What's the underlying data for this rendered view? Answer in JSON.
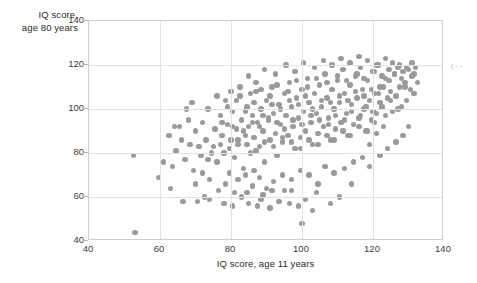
{
  "figure": {
    "background": "#ffffff",
    "point_color": "#9a9a9a",
    "grid_color": "#e2e2e2",
    "frame_color": "#cfcfcf"
  },
  "edge_marker": {
    "glyph": "‹··",
    "name": "collapse-arrow-icon",
    "color": "#d2d2d2"
  },
  "chart_data": {
    "type": "scatter",
    "title": "",
    "xlabel": "IQ score, age 11 years",
    "ylabel": "IQ score,\nage 80 years",
    "xlim": [
      40,
      140
    ],
    "ylim": [
      40,
      140
    ],
    "xticks": [
      40,
      60,
      80,
      100,
      120,
      140
    ],
    "yticks": [
      40,
      60,
      80,
      100,
      120,
      140
    ],
    "grid": true,
    "legend": null,
    "series": [
      {
        "name": "participants",
        "color": "#9a9a9a",
        "marker": "circle",
        "points": [
          [
            52.5,
            79
          ],
          [
            53.0,
            44
          ],
          [
            59.5,
            69
          ],
          [
            62.5,
            88
          ],
          [
            63.5,
            74
          ],
          [
            64.5,
            81
          ],
          [
            65.5,
            92
          ],
          [
            66.0,
            86
          ],
          [
            67.0,
            77
          ],
          [
            68.0,
            95
          ],
          [
            68.5,
            84
          ],
          [
            69.5,
            72
          ],
          [
            70.0,
            90
          ],
          [
            70.5,
            58
          ],
          [
            71.5,
            79
          ],
          [
            72.0,
            94
          ],
          [
            73.0,
            86
          ],
          [
            73.5,
            100
          ],
          [
            74.0,
            68
          ],
          [
            75.0,
            83
          ],
          [
            75.5,
            91
          ],
          [
            76.0,
            76
          ],
          [
            77.0,
            97
          ],
          [
            77.5,
            88
          ],
          [
            78.0,
            80
          ],
          [
            78.5,
            104
          ],
          [
            79.0,
            93
          ],
          [
            79.5,
            71
          ],
          [
            80.0,
            86
          ],
          [
            80.5,
            99
          ],
          [
            81.0,
            78
          ],
          [
            81.5,
            91
          ],
          [
            82.0,
            84
          ],
          [
            82.5,
            106
          ],
          [
            83.0,
            95
          ],
          [
            83.5,
            73
          ],
          [
            84.0,
            88
          ],
          [
            84.5,
            101
          ],
          [
            85.0,
            92
          ],
          [
            85.5,
            80
          ],
          [
            86.0,
            97
          ],
          [
            86.5,
            87
          ],
          [
            87.0,
            108
          ],
          [
            87.5,
            94
          ],
          [
            88.0,
            83
          ],
          [
            88.5,
            100
          ],
          [
            89.0,
            90
          ],
          [
            89.5,
            76
          ],
          [
            90.0,
            104
          ],
          [
            90.5,
            95
          ],
          [
            91.0,
            86
          ],
          [
            91.5,
            110
          ],
          [
            92.0,
            98
          ],
          [
            92.5,
            89
          ],
          [
            93.0,
            79
          ],
          [
            93.5,
            102
          ],
          [
            94.0,
            93
          ],
          [
            94.5,
            85
          ],
          [
            95.0,
            107
          ],
          [
            95.5,
            97
          ],
          [
            96.0,
            88
          ],
          [
            96.5,
            112
          ],
          [
            97.0,
            101
          ],
          [
            97.5,
            92
          ],
          [
            98.0,
            82
          ],
          [
            98.5,
            105
          ],
          [
            99.0,
            96
          ],
          [
            99.5,
            87
          ],
          [
            100.0,
            109
          ],
          [
            100.5,
            99
          ],
          [
            101.0,
            90
          ],
          [
            101.5,
            114
          ],
          [
            102.0,
            103
          ],
          [
            102.5,
            94
          ],
          [
            103.0,
            84
          ],
          [
            103.5,
            107
          ],
          [
            104.0,
            98
          ],
          [
            104.5,
            89
          ],
          [
            105.0,
            111
          ],
          [
            105.5,
            101
          ],
          [
            106.0,
            92
          ],
          [
            106.5,
            116
          ],
          [
            107.0,
            105
          ],
          [
            107.5,
            96
          ],
          [
            108.0,
            86
          ],
          [
            108.5,
            109
          ],
          [
            109.0,
            100
          ],
          [
            109.5,
            91
          ],
          [
            110.0,
            113
          ],
          [
            110.5,
            103
          ],
          [
            111.0,
            94
          ],
          [
            111.5,
            118
          ],
          [
            112.0,
            107
          ],
          [
            112.5,
            98
          ],
          [
            113.0,
            88
          ],
          [
            113.5,
            111
          ],
          [
            114.0,
            102
          ],
          [
            114.5,
            93
          ],
          [
            115.0,
            115
          ],
          [
            115.5,
            105
          ],
          [
            116.0,
            96
          ],
          [
            116.5,
            119
          ],
          [
            117.0,
            109
          ],
          [
            117.5,
            100
          ],
          [
            118.0,
            90
          ],
          [
            118.5,
            113
          ],
          [
            119.0,
            104
          ],
          [
            119.5,
            95
          ],
          [
            120.0,
            117
          ],
          [
            120.5,
            107
          ],
          [
            121.0,
            98
          ],
          [
            121.5,
            120
          ],
          [
            122.0,
            110
          ],
          [
            122.5,
            101
          ],
          [
            123.0,
            92
          ],
          [
            123.5,
            114
          ],
          [
            124.0,
            105
          ],
          [
            124.5,
            118
          ],
          [
            125.0,
            108
          ],
          [
            125.5,
            99
          ],
          [
            126.0,
            116
          ],
          [
            126.5,
            106
          ],
          [
            127.0,
            119
          ],
          [
            127.5,
            110
          ],
          [
            128.0,
            101
          ],
          [
            128.5,
            117
          ],
          [
            129.0,
            112
          ],
          [
            129.5,
            104
          ],
          [
            130.0,
            118
          ],
          [
            130.5,
            109
          ],
          [
            131.0,
            115
          ],
          [
            131.5,
            107
          ],
          [
            132.0,
            119
          ],
          [
            81.0,
            62
          ],
          [
            83.0,
            60
          ],
          [
            84.5,
            62
          ],
          [
            88.5,
            59
          ],
          [
            89.0,
            61
          ],
          [
            90.0,
            64
          ],
          [
            91.5,
            63
          ],
          [
            93.5,
            58
          ],
          [
            96.5,
            57
          ],
          [
            99.0,
            56
          ],
          [
            101.0,
            59
          ],
          [
            103.0,
            54
          ],
          [
            108.0,
            57
          ],
          [
            110.5,
            60
          ],
          [
            72.5,
            60
          ],
          [
            95.0,
            63
          ],
          [
            86.0,
            65
          ],
          [
            78.5,
            66
          ],
          [
            76.5,
            63
          ],
          [
            82.0,
            68
          ],
          [
            84.0,
            70
          ],
          [
            86.5,
            72
          ],
          [
            88.0,
            69
          ],
          [
            92.0,
            67
          ],
          [
            94.5,
            70
          ],
          [
            97.0,
            68
          ],
          [
            99.5,
            72
          ],
          [
            102.0,
            70
          ],
          [
            104.5,
            66
          ],
          [
            106.5,
            74
          ],
          [
            109.0,
            71
          ],
          [
            112.0,
            73
          ],
          [
            114.5,
            76
          ],
          [
            117.0,
            78
          ],
          [
            119.0,
            74
          ],
          [
            122.0,
            79
          ],
          [
            124.0,
            82
          ],
          [
            126.5,
            85
          ],
          [
            128.5,
            88
          ],
          [
            130.0,
            92
          ],
          [
            85.0,
            115
          ],
          [
            87.0,
            112
          ],
          [
            89.5,
            118
          ],
          [
            92.5,
            116
          ],
          [
            95.5,
            120
          ],
          [
            98.0,
            117
          ],
          [
            100.5,
            121
          ],
          [
            103.5,
            119
          ],
          [
            106.0,
            122
          ],
          [
            108.5,
            120
          ],
          [
            111.0,
            123
          ],
          [
            113.5,
            121
          ],
          [
            116.0,
            124
          ],
          [
            118.5,
            122
          ],
          [
            121.0,
            120
          ],
          [
            123.5,
            123
          ],
          [
            125.5,
            121
          ],
          [
            127.5,
            120
          ],
          [
            129.5,
            119
          ],
          [
            131.0,
            121
          ],
          [
            80.0,
            108
          ],
          [
            82.5,
            110
          ],
          [
            85.5,
            107
          ],
          [
            88.5,
            109
          ],
          [
            91.0,
            106
          ],
          [
            93.0,
            111
          ],
          [
            96.0,
            108
          ],
          [
            98.5,
            113
          ],
          [
            101.5,
            110
          ],
          [
            104.0,
            114
          ],
          [
            107.0,
            112
          ],
          [
            110.0,
            115
          ],
          [
            112.5,
            113
          ],
          [
            115.5,
            116
          ],
          [
            117.5,
            114
          ],
          [
            120.5,
            117
          ],
          [
            122.5,
            115
          ],
          [
            124.5,
            113
          ],
          [
            126.0,
            116
          ],
          [
            128.0,
            114
          ],
          [
            79.0,
            101
          ],
          [
            81.5,
            104
          ],
          [
            84.0,
            99
          ],
          [
            86.5,
            103
          ],
          [
            89.0,
            97
          ],
          [
            91.5,
            102
          ],
          [
            94.0,
            100
          ],
          [
            96.5,
            104
          ],
          [
            99.0,
            102
          ],
          [
            101.0,
            106
          ],
          [
            103.0,
            100
          ],
          [
            105.5,
            104
          ],
          [
            108.0,
            103
          ],
          [
            110.5,
            106
          ],
          [
            113.0,
            104
          ],
          [
            115.0,
            108
          ],
          [
            117.5,
            106
          ],
          [
            119.5,
            109
          ],
          [
            121.5,
            107
          ],
          [
            123.0,
            110
          ],
          [
            77.5,
            94
          ],
          [
            80.5,
            92
          ],
          [
            83.5,
            90
          ],
          [
            86.0,
            94
          ],
          [
            88.0,
            92
          ],
          [
            90.5,
            96
          ],
          [
            93.0,
            94
          ],
          [
            95.0,
            91
          ],
          [
            97.5,
            95
          ],
          [
            100.0,
            93
          ],
          [
            102.5,
            97
          ],
          [
            105.0,
            95
          ],
          [
            107.5,
            93
          ],
          [
            109.5,
            97
          ],
          [
            112.0,
            95
          ],
          [
            114.0,
            99
          ],
          [
            116.5,
            97
          ],
          [
            118.0,
            101
          ],
          [
            120.0,
            99
          ],
          [
            122.0,
            103
          ],
          [
            74.5,
            80
          ],
          [
            77.0,
            84
          ],
          [
            79.5,
            82
          ],
          [
            82.0,
            86
          ],
          [
            84.5,
            84
          ],
          [
            87.0,
            81
          ],
          [
            89.5,
            85
          ],
          [
            92.0,
            83
          ],
          [
            94.5,
            87
          ],
          [
            97.0,
            85
          ],
          [
            99.5,
            82
          ],
          [
            102.0,
            86
          ],
          [
            104.5,
            84
          ],
          [
            107.0,
            88
          ],
          [
            109.0,
            86
          ],
          [
            111.5,
            90
          ],
          [
            113.5,
            88
          ],
          [
            116.0,
            92
          ],
          [
            118.5,
            90
          ],
          [
            120.5,
            94
          ],
          [
            66.5,
            58
          ],
          [
            70.0,
            66
          ],
          [
            72.0,
            71
          ],
          [
            74.0,
            59
          ],
          [
            63.0,
            64
          ],
          [
            61.0,
            76
          ],
          [
            64.0,
            92
          ],
          [
            67.5,
            100
          ],
          [
            69.0,
            103
          ],
          [
            71.0,
            83
          ],
          [
            73.5,
            77
          ],
          [
            76.0,
            106
          ],
          [
            132.5,
            112
          ],
          [
            131.5,
            116
          ],
          [
            129.0,
            110
          ],
          [
            125.0,
            104
          ],
          [
            127.0,
            100
          ],
          [
            123.5,
            97
          ],
          [
            121.0,
            89
          ],
          [
            119.0,
            84
          ],
          [
            100.0,
            48
          ],
          [
            114.0,
            66
          ],
          [
            104.0,
            62
          ],
          [
            97.0,
            63
          ],
          [
            91.0,
            55
          ],
          [
            87.5,
            56
          ],
          [
            85.0,
            57
          ],
          [
            80.5,
            56
          ],
          [
            78.0,
            57
          ]
        ]
      }
    ]
  }
}
